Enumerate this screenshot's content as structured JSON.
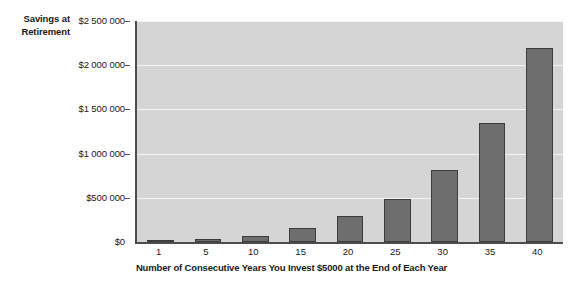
{
  "chart_data": {
    "type": "bar",
    "title": "",
    "xlabel": "Number of Consecutive Years You Invest $5000 at the End of Each Year",
    "ylabel": "Savings at Retirement",
    "ylabel_lines": [
      "Savings at",
      "Retirement"
    ],
    "categories": [
      "1",
      "5",
      "10",
      "15",
      "20",
      "25",
      "30",
      "35",
      "40"
    ],
    "values": [
      5000,
      30000,
      65000,
      155000,
      290000,
      490000,
      810000,
      1350000,
      2200000
    ],
    "ylim": [
      0,
      2500000
    ],
    "ytick_values": [
      2500000,
      2000000,
      1500000,
      1000000,
      500000,
      0
    ],
    "ytick_labels": [
      "$2 500 000",
      "$2 000 000",
      "$1 500 000",
      "$1 000 000",
      "$500 000",
      "$0"
    ],
    "xtick_labels": [
      "1",
      "5",
      "10",
      "15",
      "20",
      "25",
      "30",
      "35",
      "40"
    ],
    "grid": true,
    "legend": "none",
    "colors": {
      "bar_fill": "#6e6e6e",
      "bar_edge": "#3c3c3c",
      "plot_background": "#d5d5d5",
      "gridline": "#f4f4f4",
      "axis": "#4d4d4d",
      "text": "#1a1a1a",
      "page_background": "#ffffff"
    }
  }
}
